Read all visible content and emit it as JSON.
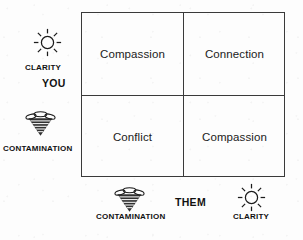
{
  "diagram": {
    "type": "two-by-two-matrix",
    "axes": {
      "vertical": {
        "title": "YOU",
        "high_label": "CLARITY",
        "high_icon": "sun-icon",
        "low_label": "CONTAMINATION",
        "low_icon": "tornado-icon"
      },
      "horizontal": {
        "title": "THEM",
        "low_label": "CONTAMINATION",
        "low_icon": "tornado-icon",
        "high_label": "CLARITY",
        "high_icon": "sun-icon"
      }
    },
    "quadrants": {
      "top_left": "Compassion",
      "top_right": "Connection",
      "bottom_left": "Conflict",
      "bottom_right": "Compassion"
    },
    "colors": {
      "border": "#3a3a3a",
      "text": "#1b1b1b",
      "background": "#fdfdfd"
    }
  }
}
